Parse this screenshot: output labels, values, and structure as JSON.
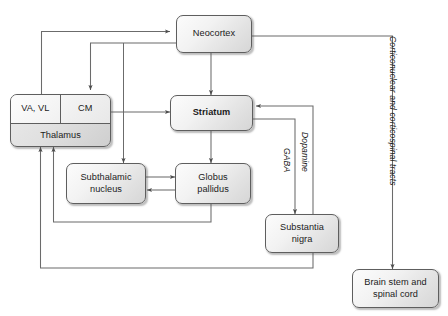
{
  "diagram": {
    "nodes": [
      {
        "id": "neocortex",
        "label": "Neocortex",
        "bold": false
      },
      {
        "id": "thalamus",
        "label": "Thalamus",
        "bold": false
      },
      {
        "id": "va_vl",
        "label": "VA, VL",
        "bold": false
      },
      {
        "id": "cm",
        "label": "CM",
        "bold": false
      },
      {
        "id": "striatum",
        "label": "Striatum",
        "bold": true
      },
      {
        "id": "subthalamic",
        "label": "Subthalamic\nnucleus",
        "bold": false
      },
      {
        "id": "globus",
        "label": "Globus\npallidus",
        "bold": false
      },
      {
        "id": "substantia",
        "label": "Substantia\nnigra",
        "bold": false
      },
      {
        "id": "brainstem",
        "label": "Brain stem and\nspinal cord",
        "bold": false
      }
    ],
    "node_labels": {
      "neocortex": "Neocortex",
      "thalamus": "Thalamus",
      "va_vl": "VA, VL",
      "cm": "CM",
      "striatum": "Striatum",
      "subthalamic_line1": "Subthalamic",
      "subthalamic_line2": "nucleus",
      "globus_line1": "Globus",
      "globus_line2": "pallidus",
      "substantia_line1": "Substantia",
      "substantia_line2": "nigra",
      "brainstem_line1": "Brain stem and",
      "brainstem_line2": "spinal cord"
    },
    "edge_labels": {
      "gaba": "GABA",
      "dopamine": "Dopamine",
      "tracts": "Corticonuclear and corticospinal tracts"
    },
    "connections": [
      {
        "from": "va_vl",
        "to": "neocortex",
        "label": ""
      },
      {
        "from": "neocortex",
        "to": "cm",
        "label": ""
      },
      {
        "from": "neocortex",
        "to": "striatum",
        "label": ""
      },
      {
        "from": "neocortex",
        "to": "subthalamic",
        "label": ""
      },
      {
        "from": "neocortex",
        "to": "brainstem",
        "label": "Corticonuclear and corticospinal tracts"
      },
      {
        "from": "cm",
        "to": "striatum",
        "label": ""
      },
      {
        "from": "striatum",
        "to": "globus",
        "label": ""
      },
      {
        "from": "subthalamic",
        "to": "globus",
        "label": ""
      },
      {
        "from": "globus",
        "to": "subthalamic",
        "label": ""
      },
      {
        "from": "globus",
        "to": "thalamus",
        "label": ""
      },
      {
        "from": "striatum",
        "to": "substantia",
        "label": "GABA"
      },
      {
        "from": "substantia",
        "to": "striatum",
        "label": "Dopamine"
      },
      {
        "from": "substantia",
        "to": "thalamus",
        "label": ""
      }
    ],
    "colors": {
      "line": "#6b6b6b",
      "node_border": "#5e5e5e",
      "node_fill_light": "#fcfcfc",
      "node_fill_dark": "#d6d6d6",
      "text": "#1b1b1b",
      "background": "#ffffff"
    }
  }
}
